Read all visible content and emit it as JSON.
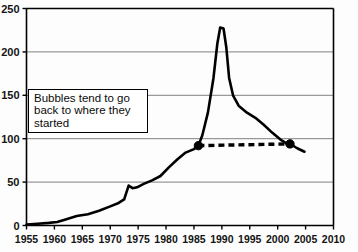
{
  "chart_data": {
    "type": "line",
    "title": "",
    "xlabel": "",
    "ylabel": "",
    "xlim": [
      1955,
      2010
    ],
    "ylim": [
      0,
      250
    ],
    "grid": true,
    "legend": false,
    "x_ticks": [
      1955,
      1960,
      1965,
      1970,
      1975,
      1980,
      1985,
      1990,
      1995,
      2000,
      2005,
      2010
    ],
    "y_ticks": [
      0,
      50,
      100,
      150,
      200,
      250
    ],
    "series": [
      {
        "name": "index",
        "style": "solid",
        "points": [
          [
            1955.0,
            1
          ],
          [
            1957.0,
            2
          ],
          [
            1959.0,
            3
          ],
          [
            1960.5,
            4
          ],
          [
            1962.0,
            7
          ],
          [
            1964.0,
            11
          ],
          [
            1966.0,
            13
          ],
          [
            1968.0,
            17
          ],
          [
            1970.0,
            22
          ],
          [
            1971.5,
            26
          ],
          [
            1972.5,
            30
          ],
          [
            1973.3,
            46
          ],
          [
            1974.0,
            43
          ],
          [
            1974.8,
            44
          ],
          [
            1976.0,
            48
          ],
          [
            1977.5,
            52
          ],
          [
            1979.0,
            57
          ],
          [
            1980.5,
            67
          ],
          [
            1982.0,
            76
          ],
          [
            1983.5,
            84
          ],
          [
            1985.0,
            88
          ],
          [
            1985.8,
            92
          ],
          [
            1986.5,
            104
          ],
          [
            1987.5,
            130
          ],
          [
            1988.5,
            170
          ],
          [
            1989.2,
            210
          ],
          [
            1989.7,
            228
          ],
          [
            1990.3,
            227
          ],
          [
            1990.8,
            205
          ],
          [
            1991.3,
            170
          ],
          [
            1992.0,
            150
          ],
          [
            1993.0,
            138
          ],
          [
            1994.5,
            130
          ],
          [
            1996.0,
            124
          ],
          [
            1997.5,
            116
          ],
          [
            1999.0,
            107
          ],
          [
            2000.5,
            99
          ],
          [
            2001.5,
            95
          ],
          [
            2002.2,
            94
          ],
          [
            2003.5,
            89
          ],
          [
            2004.8,
            85
          ]
        ]
      },
      {
        "name": "return-to-start",
        "style": "dashed",
        "points": [
          [
            1985.8,
            92
          ],
          [
            2002.2,
            94
          ]
        ],
        "markers": [
          {
            "x": 1985.8,
            "y": 92
          },
          {
            "x": 2002.2,
            "y": 94
          }
        ]
      }
    ],
    "annotations": [
      {
        "name": "bubbles-note",
        "text": "Bubbles tend to go\nback to where they\nstarted"
      }
    ]
  },
  "colors": {
    "line": "#000000",
    "grid": "#808080",
    "axis": "#000000",
    "background": "#fdfdfd",
    "text": "#0a0a0a"
  }
}
